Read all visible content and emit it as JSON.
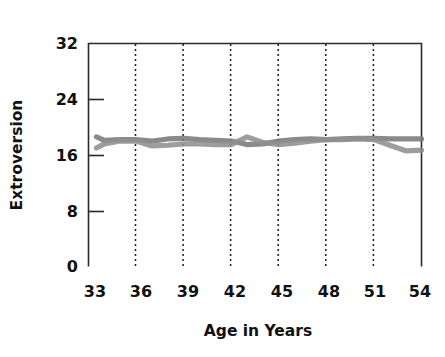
{
  "chart_data": {
    "type": "line",
    "title": "",
    "xlabel": "Age in Years",
    "ylabel": "Extroversion",
    "xlim": [
      33,
      54
    ],
    "ylim": [
      0,
      32
    ],
    "xticks": [
      33,
      36,
      39,
      42,
      45,
      48,
      51,
      54
    ],
    "yticks": [
      0,
      8,
      16,
      24,
      32
    ],
    "xtick_labels": [
      "33",
      "36",
      "39",
      "42",
      "45",
      "48",
      "51",
      "54"
    ],
    "ytick_labels": [
      "0",
      "8",
      "16",
      "24",
      "32"
    ],
    "grid": "vertical-dashed",
    "gridline_positions": [
      36,
      39,
      42,
      45,
      48,
      51
    ],
    "legend": "none",
    "x": [
      33.5,
      34,
      35,
      36,
      37,
      38,
      39,
      40,
      41,
      42,
      43,
      44,
      45,
      46,
      47,
      48,
      49,
      50,
      51,
      52,
      53,
      54
    ],
    "series": [
      {
        "name": "series-1",
        "color": "#7a7a7a",
        "values": [
          18.6,
          18.1,
          18.2,
          18.2,
          18.0,
          18.3,
          18.4,
          18.2,
          18.1,
          18.0,
          17.5,
          17.6,
          18.0,
          18.2,
          18.3,
          18.2,
          18.3,
          18.4,
          18.4,
          18.3,
          18.3,
          18.3
        ]
      },
      {
        "name": "series-2",
        "color": "#8f8f8f",
        "values": [
          17.0,
          17.6,
          18.0,
          18.0,
          17.3,
          17.4,
          17.6,
          17.6,
          17.5,
          17.5,
          18.6,
          17.8,
          17.5,
          17.7,
          18.0,
          18.2,
          18.2,
          18.3,
          18.2,
          17.4,
          16.6,
          16.7
        ]
      }
    ]
  },
  "axes": {
    "ylabel": "Extroversion",
    "xlabel": "Age in Years"
  }
}
